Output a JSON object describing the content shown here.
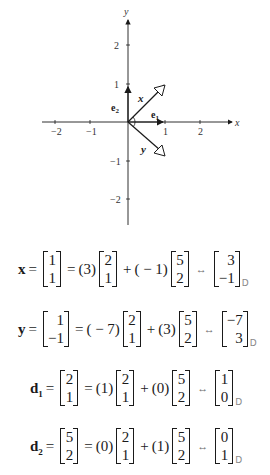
{
  "graph": {
    "x_axis_label": "x",
    "y_axis_label": "y",
    "x_ticks": [
      "−2",
      "−1",
      "1",
      "2"
    ],
    "y_ticks": [
      "2",
      "1",
      "−1",
      "−2"
    ],
    "vectors": {
      "x": {
        "label": "x",
        "coords": [
          1,
          1
        ]
      },
      "y": {
        "label": "y",
        "coords": [
          1,
          -1
        ]
      },
      "e1": {
        "label": "e",
        "sub": "1",
        "coords": [
          1,
          0
        ]
      },
      "e2": {
        "label": "e",
        "sub": "2",
        "coords": [
          0,
          1
        ]
      }
    }
  },
  "equations": [
    {
      "lhs": "x",
      "lhs_sub": "",
      "vec": [
        "1",
        "1"
      ],
      "c1": "(3)",
      "b1": [
        "2",
        "1"
      ],
      "c2": "( − 1)",
      "b2": [
        "5",
        "2"
      ],
      "coords": [
        "3",
        "−1"
      ],
      "basis": "D"
    },
    {
      "lhs": "y",
      "lhs_sub": "",
      "vec": [
        "1",
        "−1"
      ],
      "c1": "( − 7)",
      "b1": [
        "2",
        "1"
      ],
      "c2": "(3)",
      "b2": [
        "5",
        "2"
      ],
      "coords": [
        "−7",
        "3"
      ],
      "basis": "D"
    },
    {
      "lhs": "d",
      "lhs_sub": "1",
      "vec": [
        "2",
        "1"
      ],
      "c1": "(1)",
      "b1": [
        "2",
        "1"
      ],
      "c2": "(0)",
      "b2": [
        "5",
        "2"
      ],
      "coords": [
        "1",
        "0"
      ],
      "basis": "D"
    },
    {
      "lhs": "d",
      "lhs_sub": "2",
      "vec": [
        "5",
        "2"
      ],
      "c1": "(0)",
      "b1": [
        "2",
        "1"
      ],
      "c2": "(1)",
      "b2": [
        "5",
        "2"
      ],
      "coords": [
        "0",
        "1"
      ],
      "basis": "D"
    }
  ],
  "symbols": {
    "eq": "=",
    "plus": "+",
    "iso": "↔"
  }
}
